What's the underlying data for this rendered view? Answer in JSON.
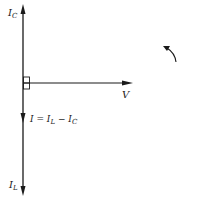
{
  "diagram": {
    "type": "phasor-diagram",
    "labels": {
      "capacitive_current": {
        "main": "I",
        "sub": "C"
      },
      "inductive_current": {
        "main": "I",
        "sub": "L"
      },
      "voltage": "V",
      "resultant": {
        "lhs": "I",
        "eq": " = ",
        "t1_main": "I",
        "t1_sub": "L",
        "minus": " − ",
        "t2_main": "I",
        "t2_sub": "C"
      }
    },
    "rotation_indicator": "counter-clockwise",
    "colors": {
      "line": "#1a1a1a",
      "background": "#ffffff"
    }
  }
}
